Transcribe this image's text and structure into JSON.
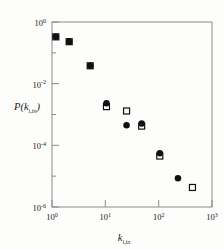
{
  "figure": {
    "background_color": "#fdfdfc",
    "frame_color": "#8a8a8a",
    "marker_color": "#111111"
  },
  "chart_data": {
    "type": "scatter",
    "title": "",
    "xlabel": "k_{i,in}",
    "ylabel": "P(k_{i,in})",
    "xlabel_base": "k",
    "xlabel_sub": "i,in",
    "ylabel_open": "P(",
    "ylabel_base": "k",
    "ylabel_sub": "i,in",
    "ylabel_close": ")",
    "xscale": "log",
    "yscale": "log",
    "xlim": [
      1,
      1000
    ],
    "ylim": [
      1e-06,
      1
    ],
    "grid": false,
    "legend": "none",
    "xticks": [
      1,
      10,
      100,
      1000
    ],
    "xtick_labels": [
      "10^0",
      "10^1",
      "10^2",
      "10^3"
    ],
    "xtick_mantissa": [
      "10",
      "10",
      "10",
      "10"
    ],
    "xtick_exponents": [
      "0",
      "1",
      "2",
      "3"
    ],
    "yticks": [
      1,
      0.01,
      0.0001,
      1e-06
    ],
    "ytick_labels": [
      "10^0",
      "10^-2",
      "10^-4",
      "10^-6"
    ],
    "ytick_mantissa": [
      "10",
      "10",
      "10",
      "10"
    ],
    "ytick_exponents": [
      "0",
      "-2",
      "-4",
      "-6"
    ],
    "series": [
      {
        "name": "filled-circles",
        "marker": "filled-circle",
        "marker_size": 6.5,
        "color": "#111111",
        "x": [
          1.18,
          2.1,
          5.2,
          10.5,
          25.0,
          48.0,
          105.0,
          230.0
        ],
        "y": [
          0.33,
          0.23,
          0.038,
          0.0023,
          0.00045,
          0.00051,
          5.5e-05,
          8.5e-06
        ]
      },
      {
        "name": "open-squares",
        "marker": "open-square",
        "marker_size": 6.0,
        "color": "#111111",
        "x": [
          1.18,
          2.1,
          5.2,
          10.5,
          25.0,
          48.0,
          105.0,
          430.0
        ],
        "y": [
          0.33,
          0.23,
          0.038,
          0.0018,
          0.0013,
          0.00042,
          4.5e-05,
          4.3e-06
        ]
      }
    ]
  }
}
